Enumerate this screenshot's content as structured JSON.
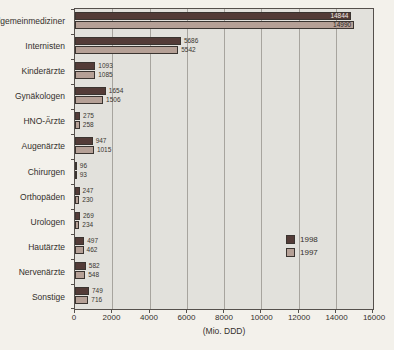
{
  "chart_data": {
    "type": "bar",
    "orientation": "horizontal",
    "title": "",
    "xlabel": "(Mio. DDD)",
    "ylabel": "",
    "xlim": [
      0,
      16000
    ],
    "xticks": [
      0,
      2000,
      4000,
      6000,
      8000,
      10000,
      12000,
      14000,
      16000
    ],
    "grid": "vertical",
    "legend_position": "inside-right",
    "categories": [
      "Allgemeinmediziner",
      "Internisten",
      "Kinderärzte",
      "Gynäkologen",
      "HNO-Ärzte",
      "Augenärzte",
      "Chirurgen",
      "Orthopäden",
      "Urologen",
      "Hautärzte",
      "Nervenärzte",
      "Sonstige"
    ],
    "series": [
      {
        "name": "1998",
        "color": "#533b37",
        "values": [
          14844,
          5686,
          1093,
          1654,
          275,
          947,
          96,
          247,
          269,
          497,
          582,
          749
        ]
      },
      {
        "name": "1997",
        "color": "#b5a096",
        "values": [
          14990,
          5542,
          1085,
          1506,
          258,
          1015,
          93,
          230,
          234,
          462,
          548,
          716
        ]
      }
    ]
  },
  "colors": {
    "plot_background": "#e2e1dc",
    "page_background": "#f3f1eb",
    "gridline": "#a7a49e",
    "border": "#55504c"
  }
}
